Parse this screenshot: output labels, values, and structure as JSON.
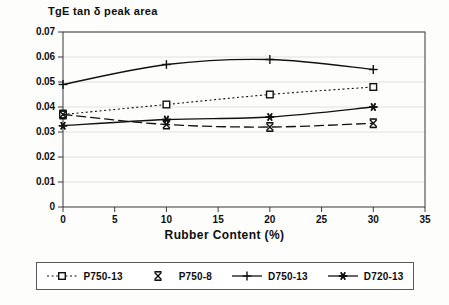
{
  "chart_data": {
    "type": "line",
    "title": "TgE tan δ peak area",
    "xlabel": "Rubber Content (%)",
    "ylabel": "",
    "xlim": [
      0,
      35
    ],
    "ylim": [
      0,
      0.07
    ],
    "grid": true,
    "legend_position": "below",
    "x": [
      0,
      10,
      20,
      30
    ],
    "xticks": [
      "0",
      "5",
      "10",
      "15",
      "20",
      "25",
      "30",
      "35"
    ],
    "xtick_values": [
      0,
      5,
      10,
      15,
      20,
      25,
      30,
      35
    ],
    "yticks": [
      "0",
      "0.01",
      "0.02",
      "0.03",
      "0.04",
      "0.05",
      "0.06",
      "0.07"
    ],
    "ytick_values": [
      0,
      0.01,
      0.02,
      0.03,
      0.04,
      0.05,
      0.06,
      0.07
    ],
    "series": [
      {
        "name": "P750-13",
        "marker": "open-square",
        "line": "dotted",
        "color": "#111111",
        "values": [
          0.037,
          0.041,
          0.045,
          0.048
        ]
      },
      {
        "name": "P750-8",
        "marker": "x-cross",
        "line": "dashed",
        "color": "#111111",
        "values": [
          0.037,
          0.033,
          0.032,
          0.0335
        ]
      },
      {
        "name": "D750-13",
        "marker": "plus",
        "line": "solid",
        "color": "#111111",
        "values": [
          0.049,
          0.057,
          0.059,
          0.055
        ]
      },
      {
        "name": "D720-13",
        "marker": "asterisk",
        "line": "solid",
        "color": "#111111",
        "values": [
          0.0325,
          0.035,
          0.036,
          0.04
        ]
      }
    ]
  },
  "axes": {
    "title": "TgE tan δ peak area",
    "xaxis_title": "Rubber Content (%)"
  },
  "legend": {
    "items": [
      {
        "label": "P750-13"
      },
      {
        "label": "P750-8"
      },
      {
        "label": "D750-13"
      },
      {
        "label": "D720-13"
      }
    ]
  }
}
